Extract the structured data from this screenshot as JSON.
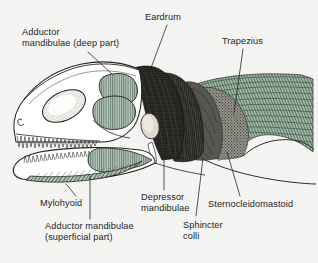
{
  "figure": {
    "background_color": "#f4f4f2",
    "ink_color": "#1d1d1d",
    "muscle_green": "#7d9384",
    "muscle_green_light": "#9fb3a4",
    "muscle_dark": "#262522",
    "muscle_mid_dark": "#4a4a46"
  },
  "labels": [
    {
      "id": "adductor-deep",
      "text": "Adductor\nmandibulae (deep part)",
      "x": 22,
      "y": 27,
      "align": "left",
      "leader": {
        "x1": 88,
        "y1": 52,
        "x2": 112,
        "y2": 74
      }
    },
    {
      "id": "eardrum",
      "text": "Eardrum",
      "x": 145,
      "y": 12,
      "align": "left",
      "leader": {
        "x1": 167,
        "y1": 25,
        "x2": 148,
        "y2": 76
      }
    },
    {
      "id": "trapezius",
      "text": "Trapezius",
      "x": 222,
      "y": 36,
      "align": "left",
      "leader": {
        "x1": 243,
        "y1": 49,
        "x2": 234,
        "y2": 113
      }
    },
    {
      "id": "depressor-mandibulae",
      "text": "Depressor\nmandibulae",
      "x": 141,
      "y": 192,
      "align": "left",
      "leader": {
        "x1": 164,
        "y1": 190,
        "x2": 164,
        "y2": 157
      }
    },
    {
      "id": "sternocleidomastoid",
      "text": "Sternocleidomastoid",
      "x": 208,
      "y": 199,
      "align": "left",
      "leader": {
        "x1": 240,
        "y1": 196,
        "x2": 227,
        "y2": 152
      }
    },
    {
      "id": "sphincter-colli",
      "text": "Sphincter\ncolli",
      "x": 183,
      "y": 220,
      "align": "left",
      "leader": {
        "x1": 196,
        "y1": 216,
        "x2": 203,
        "y2": 158
      }
    },
    {
      "id": "mylohyoid",
      "text": "Mylohyoid",
      "x": 40,
      "y": 198,
      "align": "left",
      "leader": {
        "x1": 76,
        "y1": 196,
        "x2": 66,
        "y2": 184
      }
    },
    {
      "id": "adductor-superficial",
      "text": "Adductor mandibulae\n(superficial part)",
      "x": 45,
      "y": 221,
      "align": "left",
      "leader": {
        "x1": 90,
        "y1": 219,
        "x2": 90,
        "y2": 176
      }
    }
  ],
  "anatomy_regions": [
    {
      "id": "skull-outline",
      "name": "skull",
      "fill": "#ffffff"
    },
    {
      "id": "orbit",
      "name": "orbit (eye socket)",
      "fill": "#ffffff",
      "texture": "stipple"
    },
    {
      "id": "naris",
      "name": "external naris",
      "fill": "#ffffff"
    },
    {
      "id": "upper-tooth-row",
      "name": "upper tooth row",
      "fill": "#ffffff"
    },
    {
      "id": "lower-tooth-row",
      "name": "lower tooth row",
      "fill": "#ffffff"
    },
    {
      "id": "adductor-deep-muscle",
      "name": "adductor mandibulae deep part",
      "fill": "#7d9384",
      "texture": "fine-hatch"
    },
    {
      "id": "adductor-mid-muscle",
      "name": "adductor mandibulae middle fenestra",
      "fill": "#7d9384",
      "texture": "fine-hatch"
    },
    {
      "id": "adductor-superficial-muscle",
      "name": "adductor mandibulae superficial part",
      "fill": "#7d9384",
      "texture": "fine-hatch"
    },
    {
      "id": "mylohyoid-muscle",
      "name": "mylohyoid",
      "fill": "#8fa594",
      "texture": "diagonal-hatch"
    },
    {
      "id": "eardrum-region",
      "name": "eardrum / tympanum",
      "fill": "#262522",
      "texture": "dense"
    },
    {
      "id": "depressor-mandibulae-muscle",
      "name": "depressor mandibulae",
      "fill": "#2b2a27",
      "texture": "dense-vertical"
    },
    {
      "id": "sphincter-colli-muscle",
      "name": "sphincter colli",
      "fill": "#4a4a46",
      "texture": "stipple"
    },
    {
      "id": "sternocleidomastoid-muscle",
      "name": "sternocleidomastoid",
      "fill": "#5a5a54",
      "texture": "stipple"
    },
    {
      "id": "trapezius-muscle",
      "name": "trapezius",
      "fill": "#7d9384",
      "texture": "curved-hatch"
    }
  ]
}
